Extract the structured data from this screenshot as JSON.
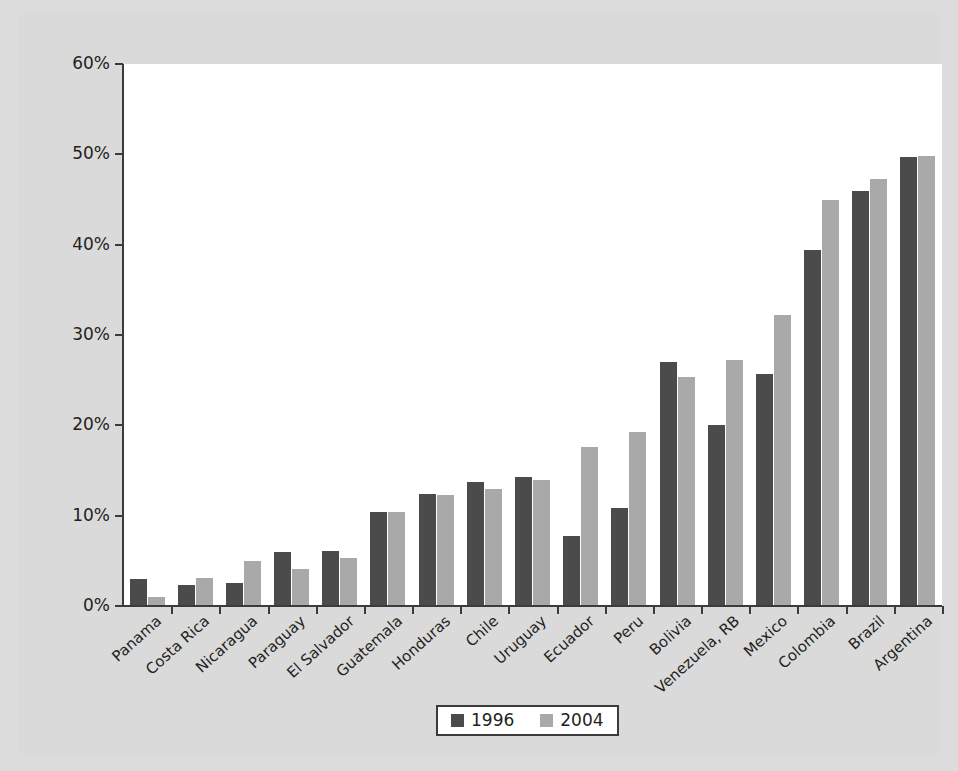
{
  "chart_data": {
    "type": "bar",
    "title": "",
    "subtitle": "",
    "xlabel": "",
    "ylabel": "",
    "ylim": [
      0,
      60
    ],
    "ytick_labels": [
      "0%",
      "10%",
      "20%",
      "30%",
      "40%",
      "50%",
      "60%"
    ],
    "ytick_values": [
      0,
      10,
      20,
      30,
      40,
      50,
      60
    ],
    "grid": false,
    "legend_position": "bottom-center",
    "value_unit": "percent",
    "categories": [
      "Panama",
      "Costa Rica",
      "Nicaragua",
      "Paraguay",
      "El Salvador",
      "Guatemala",
      "Honduras",
      "Chile",
      "Uruguay",
      "Ecuador",
      "Peru",
      "Bolivia",
      "Venezuela, RB",
      "Mexico",
      "Colombia",
      "Brazil",
      "Argentina"
    ],
    "series": [
      {
        "name": "1996",
        "color": "#4b4b4b",
        "values": [
          3.0,
          2.3,
          2.5,
          6.0,
          6.1,
          10.4,
          12.4,
          13.7,
          14.3,
          7.7,
          10.8,
          27.0,
          20.0,
          25.7,
          39.4,
          45.9,
          49.7
        ]
      },
      {
        "name": "2004",
        "color": "#a9a9a9",
        "values": [
          1.0,
          3.1,
          5.0,
          4.1,
          5.3,
          10.4,
          12.3,
          12.9,
          13.9,
          17.6,
          19.3,
          25.3,
          27.2,
          32.2,
          45.0,
          47.3,
          49.8
        ]
      }
    ]
  },
  "legend": {
    "entries": [
      {
        "label": "1996",
        "swatch": "s1996"
      },
      {
        "label": "2004",
        "swatch": "s2004"
      }
    ]
  },
  "colors": {
    "series_1996": "#4b4b4b",
    "series_2004": "#a9a9a9",
    "background": "#dcdcdc",
    "plot_background": "#ffffff",
    "axis": "#3b3b3b",
    "text": "#231f20"
  }
}
